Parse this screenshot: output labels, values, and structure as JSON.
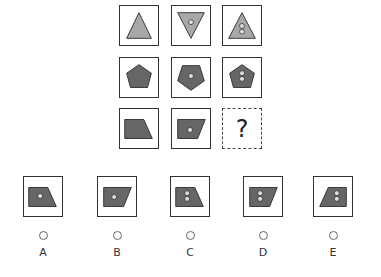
{
  "puzzle": {
    "colors": {
      "light_fill": "#a8a8a8",
      "dark_fill": "#666666",
      "stroke": "#333333",
      "dot_fill": "#dddddd"
    },
    "grid": [
      {
        "row": 1,
        "cells": [
          {
            "shape": "triangle-up",
            "fill": "light",
            "dots": 0
          },
          {
            "shape": "triangle-down",
            "fill": "light",
            "dots": 1
          },
          {
            "shape": "triangle-up",
            "fill": "light",
            "dots": 2
          }
        ]
      },
      {
        "row": 2,
        "cells": [
          {
            "shape": "pentagon",
            "fill": "dark",
            "dots": 0
          },
          {
            "shape": "pentagon-rotated",
            "fill": "dark",
            "dots": 1
          },
          {
            "shape": "pentagon",
            "fill": "dark",
            "dots": 2
          }
        ]
      },
      {
        "row": 3,
        "cells": [
          {
            "shape": "trapezoid-right-slant",
            "fill": "dark",
            "dots": 0
          },
          {
            "shape": "parallelogram",
            "fill": "dark",
            "dots": 1
          },
          {
            "shape": "unknown",
            "label": "?"
          }
        ]
      }
    ],
    "question_mark": "?",
    "options": [
      {
        "letter": "A",
        "shape": "trapezoid-right-slant",
        "dots": 1
      },
      {
        "letter": "B",
        "shape": "parallelogram",
        "dots": 1
      },
      {
        "letter": "C",
        "shape": "trapezoid-right-slant",
        "dots": 2
      },
      {
        "letter": "D",
        "shape": "parallelogram",
        "dots": 2
      },
      {
        "letter": "E",
        "shape": "trapezoid-left-slant",
        "dots": 2
      }
    ]
  }
}
